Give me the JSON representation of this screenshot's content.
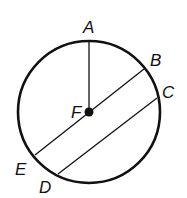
{
  "diagram": {
    "type": "circle-geometry",
    "colors": {
      "stroke": "#111111",
      "background": "#ffffff"
    },
    "circle": {
      "center_label": "F",
      "cx": 89,
      "cy": 112,
      "r": 71
    },
    "points": {
      "A": {
        "label": "A",
        "x": 89,
        "y": 41,
        "label_x": 83,
        "label_y": 33
      },
      "B": {
        "label": "B",
        "x": 144,
        "y": 69,
        "label_x": 150,
        "label_y": 66
      },
      "C": {
        "label": "C",
        "x": 157,
        "y": 98,
        "label_x": 162,
        "label_y": 98
      },
      "D": {
        "label": "D",
        "x": 58,
        "y": 174,
        "label_x": 39,
        "label_y": 193
      },
      "E": {
        "label": "E",
        "x": 35,
        "y": 155,
        "label_x": 15,
        "label_y": 175
      },
      "F": {
        "label": "F",
        "x": 89,
        "y": 112,
        "label_x": 71,
        "label_y": 118
      }
    },
    "segments": [
      {
        "name": "radius-FA",
        "from": "F",
        "to": "A"
      },
      {
        "name": "diameter-BE",
        "from": "B",
        "to": "E"
      },
      {
        "name": "chord-CD",
        "from": "C",
        "to": "D"
      }
    ]
  }
}
